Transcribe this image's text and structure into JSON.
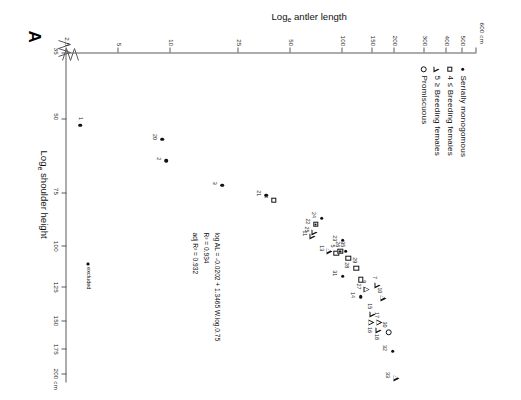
{
  "panel": {
    "label": "A"
  },
  "axes": {
    "x": {
      "title": "Log<sub>e</sub> shoulder height",
      "title_plain": "Loge shoulder height",
      "unit_suffix": "cm",
      "ticks": [
        "35",
        "50",
        "75",
        "100",
        "125",
        "150",
        "175",
        "200"
      ],
      "tick_values": [
        35,
        50,
        75,
        100,
        125,
        150,
        175,
        200
      ],
      "has_axis_break": true,
      "scale": "log"
    },
    "y": {
      "title": "Log<sub>e</sub> antler length",
      "title_plain": "Loge antler length",
      "unit_suffix": "cm",
      "ticks": [
        "2.5",
        "5",
        "10",
        "25",
        "50",
        "100",
        "150",
        "200",
        "300",
        "400",
        "500",
        "600"
      ],
      "tick_values": [
        2.5,
        5,
        10,
        25,
        50,
        100,
        150,
        200,
        300,
        400,
        500,
        600
      ],
      "top_label": "600 cm",
      "has_axis_break": true,
      "scale": "log"
    }
  },
  "legend": {
    "items": [
      {
        "symbol": "dot",
        "label": "Serially  monogomous"
      },
      {
        "symbol": "square",
        "label": "4 ≤ Breeding females"
      },
      {
        "symbol": "triangle",
        "label": "5 ≥ Breeding females"
      },
      {
        "symbol": "circle",
        "label": "Promiscuous"
      }
    ]
  },
  "annotations": {
    "regression_lines": [
      "log AL = -0.0202 + 1.3465 W.log.0.75",
      "R²  =  0.934",
      "adj R²  =  0.932"
    ],
    "excluded_note": "excluded"
  },
  "chart_data": {
    "type": "scatter",
    "title": "",
    "xlabel": "Loge shoulder height",
    "ylabel": "Loge antler length",
    "xlim": [
      35,
      210
    ],
    "ylim": [
      2.5,
      600
    ],
    "xscale": "log",
    "yscale": "log",
    "grid": false,
    "legend_position": "upper-left",
    "series": [
      {
        "name": "Serially monogomous",
        "symbol": "dot"
      },
      {
        "name": "4 ≤ Breeding females",
        "symbol": "square"
      },
      {
        "name": "5 ≥ Breeding females",
        "symbol": "triangle"
      },
      {
        "name": "Promiscuous",
        "symbol": "circle"
      }
    ],
    "points": [
      {
        "id": "1",
        "x": 52,
        "y": 3.0,
        "symbol": "dot",
        "lx": -7,
        "ly": 0
      },
      {
        "id": "2",
        "x": 63,
        "y": 9.5,
        "symbol": "dot",
        "lx": -2,
        "ly": 8
      },
      {
        "id": "3",
        "x": 72,
        "y": 20,
        "symbol": "dot",
        "lx": -2,
        "ly": 8
      },
      {
        "id": "4",
        "x": 78,
        "y": 40,
        "symbol": "square",
        "lx": -3,
        "ly": 8
      },
      {
        "id": "5",
        "x": 104,
        "y": 92,
        "symbol": "square",
        "lx": -7,
        "ly": 4
      },
      {
        "id": "7",
        "x": 124,
        "y": 160,
        "symbol": "triangle",
        "lx": -8,
        "ly": 3
      },
      {
        "id": "9",
        "x": 127,
        "y": 138,
        "symbol": "triangle",
        "lx": -8,
        "ly": 3
      },
      {
        "id": "10",
        "x": 133,
        "y": 172,
        "symbol": "triangle",
        "lx": -8,
        "ly": 4
      },
      {
        "id": "11",
        "x": 95,
        "y": 67,
        "symbol": "triangle",
        "lx": -3,
        "ly": 8
      },
      {
        "id": "13",
        "x": 103,
        "y": 84,
        "symbol": "triangle",
        "lx": -3,
        "ly": 8
      },
      {
        "id": "14",
        "x": 132,
        "y": 128,
        "symbol": "dot",
        "lx": -2,
        "ly": 8
      },
      {
        "id": "15",
        "x": 145,
        "y": 150,
        "symbol": "triangle",
        "lx": -8,
        "ly": 3
      },
      {
        "id": "16",
        "x": 152,
        "y": 147,
        "symbol": "triangle",
        "lx": 7,
        "ly": 2
      },
      {
        "id": "17",
        "x": 152,
        "y": 163,
        "symbol": "triangle",
        "lx": -8,
        "ly": 3
      },
      {
        "id": "18",
        "x": 158,
        "y": 162,
        "symbol": "triangle",
        "lx": 7,
        "ly": 2
      },
      {
        "id": "20",
        "x": 56,
        "y": 9.0,
        "symbol": "dot",
        "lx": -2,
        "ly": 8
      },
      {
        "id": "21",
        "x": 76,
        "y": 36,
        "symbol": "dot",
        "lx": -2,
        "ly": 8
      },
      {
        "id": "22",
        "x": 89,
        "y": 70,
        "symbol": "squaredot",
        "lx": -3,
        "ly": 8
      },
      {
        "id": "23",
        "x": 97,
        "y": 100,
        "symbol": "dot",
        "lx": -2,
        "ly": 8
      },
      {
        "id": "24",
        "x": 86,
        "y": 76,
        "symbol": "dot",
        "lx": -3,
        "ly": 8
      },
      {
        "id": "25",
        "x": 93,
        "y": 69,
        "symbol": "triangle",
        "lx": -3,
        "ly": 8
      },
      {
        "id": "26",
        "x": 103,
        "y": 97,
        "symbol": "squaredot",
        "lx": -7,
        "ly": 3
      },
      {
        "id": "27",
        "x": 120,
        "y": 128,
        "symbol": "square",
        "lx": 7,
        "ly": 2
      },
      {
        "id": "28",
        "x": 107,
        "y": 108,
        "symbol": "square",
        "lx": 7,
        "ly": 2
      },
      {
        "id": "29",
        "x": 113,
        "y": 120,
        "symbol": "square",
        "lx": -8,
        "ly": 2
      },
      {
        "id": "30",
        "x": 160,
        "y": 185,
        "symbol": "circle",
        "lx": -8,
        "ly": 4
      },
      {
        "id": "31",
        "x": 118,
        "y": 100,
        "symbol": "dot",
        "lx": -3,
        "ly": 8
      },
      {
        "id": "32",
        "x": 177,
        "y": 195,
        "symbol": "dot",
        "lx": -3,
        "ly": 8
      },
      {
        "id": "33",
        "x": 205,
        "y": 205,
        "symbol": "triangle",
        "lx": -3,
        "ly": 9
      },
      {
        "id": "35",
        "x": 103,
        "y": 104,
        "symbol": "dot",
        "lx": -7,
        "ly": 3
      }
    ]
  }
}
